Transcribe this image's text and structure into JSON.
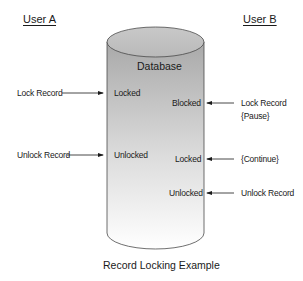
{
  "headers": {
    "user_a": "User A",
    "user_b": "User B"
  },
  "database": {
    "label": "Database"
  },
  "user_a_actions": [
    {
      "label": "Lock Record",
      "state": "Locked"
    },
    {
      "label": "Unlock Record",
      "state": "Unlocked"
    }
  ],
  "user_b_actions": [
    {
      "label": "Lock Record",
      "sub": "{Pause}",
      "state": "Blocked"
    },
    {
      "label": "{Continue}",
      "state": "Locked"
    },
    {
      "label": "Unlock Record",
      "state": "Unlocked"
    }
  ],
  "caption": "Record Locking Example"
}
